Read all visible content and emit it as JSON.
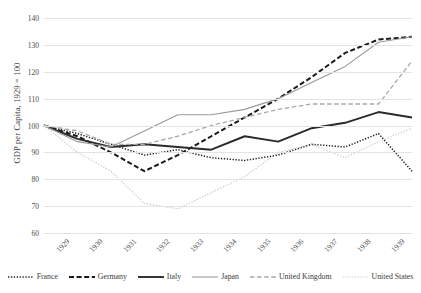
{
  "chart_data": {
    "type": "line",
    "title": "",
    "xlabel": "",
    "ylabel": "GDP per Capita, 1929 = 100",
    "ylim": [
      60,
      140
    ],
    "ytick_values": [
      60,
      70,
      80,
      90,
      100,
      110,
      120,
      130,
      140
    ],
    "grid": true,
    "legend_position": "bottom",
    "x": [
      "1929",
      "1930",
      "1931",
      "1932",
      "1933",
      "1934",
      "1935",
      "1936",
      "1937",
      "1938",
      "1939",
      "1940"
    ],
    "series": [
      {
        "name": "France",
        "style": "dotted",
        "color": "#1f1f1f",
        "values": [
          100,
          97,
          93,
          89,
          91,
          88,
          87,
          89,
          93,
          92,
          97,
          83
        ]
      },
      {
        "name": "Germany",
        "style": "dashed",
        "color": "#1a1a1a",
        "values": [
          100,
          96,
          90,
          83,
          89,
          96,
          103,
          110,
          118,
          127,
          132,
          133
        ]
      },
      {
        "name": "Italy",
        "style": "solid",
        "color": "#2b2b2b",
        "values": [
          100,
          95,
          92,
          93,
          92,
          91,
          96,
          94,
          99,
          101,
          105,
          103
        ]
      },
      {
        "name": "Japan",
        "style": "solid-light",
        "color": "#9a9a9a",
        "values": [
          100,
          94,
          92,
          98,
          104,
          104,
          106,
          110,
          116,
          122,
          131,
          133
        ]
      },
      {
        "name": "United Kingdom",
        "style": "dashed-light",
        "color": "#a8a8a8",
        "values": [
          100,
          98,
          93,
          93,
          96,
          100,
          103,
          106,
          108,
          108,
          108,
          124
        ]
      },
      {
        "name": "United States",
        "style": "dotted-light",
        "color": "#c9c9c9",
        "values": [
          100,
          90,
          83,
          71,
          69,
          75,
          81,
          90,
          93,
          88,
          94,
          99
        ]
      }
    ]
  }
}
